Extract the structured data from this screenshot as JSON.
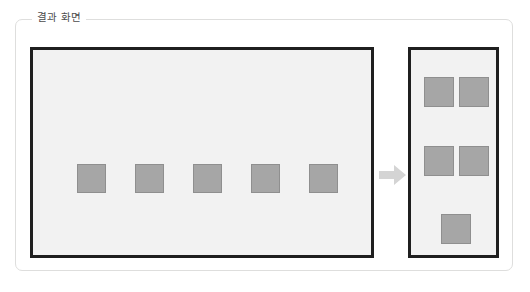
{
  "group": {
    "title": "결과 화면",
    "border_color": "#dededd",
    "title_color": "#4c4c4c"
  },
  "colors": {
    "panel_background": "#f2f2f2",
    "panel_border": "#1f1f1f",
    "square_fill": "#a6a6a6",
    "square_border": "#8f8f8f",
    "arrow_fill": "#d4d4d4",
    "page_background": "#ffffff"
  },
  "left_panel": {
    "name": "source-layout-panel",
    "square_count": 5,
    "arrangement": "single-row",
    "squares": [
      {
        "label": "",
        "x": 44,
        "y": 114
      },
      {
        "label": "",
        "x": 102,
        "y": 114
      },
      {
        "label": "",
        "x": 160,
        "y": 114
      },
      {
        "label": "",
        "x": 218,
        "y": 114
      },
      {
        "label": "",
        "x": 276,
        "y": 114
      }
    ]
  },
  "arrow": {
    "name": "transform-arrow",
    "direction": "right"
  },
  "right_panel": {
    "name": "result-layout-panel",
    "square_count": 5,
    "arrangement": "wrapped-2-2-1",
    "squares": [
      {
        "label": "",
        "x": 13,
        "y": 27
      },
      {
        "label": "",
        "x": 48,
        "y": 27
      },
      {
        "label": "",
        "x": 13,
        "y": 96
      },
      {
        "label": "",
        "x": 48,
        "y": 96
      },
      {
        "label": "",
        "x": 30,
        "y": 164
      }
    ]
  }
}
